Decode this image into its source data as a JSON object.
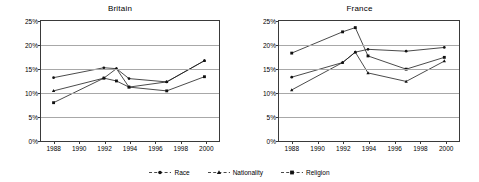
{
  "chart_data": [
    {
      "type": "line",
      "title": "Britain",
      "xlabel": "",
      "ylabel": "",
      "x": [
        1988,
        1992,
        1993,
        1994,
        1997,
        2000
      ],
      "xlim": [
        1987,
        2001
      ],
      "ylim": [
        0,
        25
      ],
      "ytick_labels": [
        "0%",
        "5%",
        "10%",
        "15%",
        "20%",
        "25%"
      ],
      "ytick_values": [
        0,
        5,
        10,
        15,
        20,
        25
      ],
      "xtick_labels": [
        "1988",
        "1990",
        "1992",
        "1994",
        "1996",
        "1998",
        "2000"
      ],
      "xtick_values": [
        1988,
        1990,
        1992,
        1994,
        1996,
        1998,
        2000
      ],
      "grid": true,
      "legend_position": "bottom-center-shared",
      "series": [
        {
          "name": "Race",
          "marker": "circle",
          "values": [
            13.0,
            15.1,
            14.9,
            12.8,
            12.1,
            16.6
          ]
        },
        {
          "name": "Nationality",
          "marker": "triangle",
          "values": [
            10.2,
            12.9,
            14.9,
            11.0,
            12.1,
            16.6
          ]
        },
        {
          "name": "Religion",
          "marker": "square",
          "values": [
            7.7,
            12.9,
            12.3,
            11.0,
            10.2,
            13.2
          ]
        }
      ]
    },
    {
      "type": "line",
      "title": "France",
      "xlabel": "",
      "ylabel": "",
      "x": [
        1988,
        1992,
        1993,
        1994,
        1997,
        2000
      ],
      "xlim": [
        1987,
        2001
      ],
      "ylim": [
        0,
        25
      ],
      "ytick_labels": [
        "0%",
        "5%",
        "10%",
        "15%",
        "20%",
        "25%"
      ],
      "ytick_values": [
        0,
        5,
        10,
        15,
        20,
        25
      ],
      "xtick_labels": [
        "1988",
        "1990",
        "1992",
        "1994",
        "1996",
        "1998",
        "2000"
      ],
      "xtick_values": [
        1988,
        1990,
        1992,
        1994,
        1996,
        1998,
        2000
      ],
      "grid": true,
      "legend_position": "bottom-center-shared",
      "series": [
        {
          "name": "Race",
          "marker": "circle",
          "values": [
            13.1,
            16.2,
            18.4,
            19.0,
            18.6,
            19.4
          ]
        },
        {
          "name": "Nationality",
          "marker": "triangle",
          "values": [
            10.4,
            16.2,
            18.4,
            14.0,
            12.2,
            16.5
          ]
        },
        {
          "name": "Religion",
          "marker": "square",
          "values": [
            18.2,
            22.7,
            23.6,
            17.6,
            14.8,
            17.3
          ]
        }
      ]
    }
  ],
  "legend": {
    "items": [
      {
        "label": "Race",
        "marker": "circle"
      },
      {
        "label": "Nationality",
        "marker": "triangle"
      },
      {
        "label": "Religion",
        "marker": "square"
      }
    ]
  }
}
